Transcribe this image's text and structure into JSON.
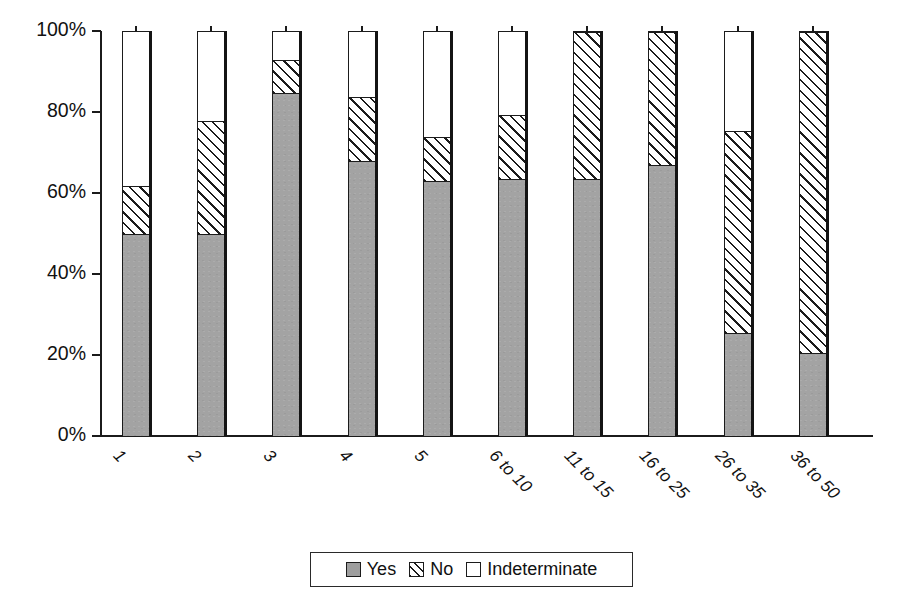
{
  "chart_data": {
    "type": "bar",
    "subtype": "stacked-100-percent",
    "title": "",
    "xlabel": "",
    "ylabel": "",
    "ylim": [
      0,
      100
    ],
    "ytick_labels": [
      "100%",
      "80%",
      "60%",
      "40%",
      "20%",
      "0%"
    ],
    "ytick_values": [
      100,
      80,
      60,
      40,
      20,
      0
    ],
    "grid": false,
    "legend_position": "bottom-center",
    "categories": [
      "1",
      "2",
      "3",
      "4",
      "5",
      "6 to 10",
      "11 to 15",
      "16 to 25",
      "26 to 35",
      "36 to 50"
    ],
    "series": [
      {
        "name": "Yes",
        "color": "#a3a3a3",
        "fill": "solid-gray",
        "values": [
          50,
          50,
          85,
          68,
          63,
          63.5,
          63.5,
          67,
          25.5,
          20.5
        ]
      },
      {
        "name": "No",
        "color": "#ffffff",
        "fill": "diagonal-hatch",
        "values": [
          12,
          28,
          8,
          16,
          11,
          16,
          36.5,
          33,
          50,
          79.5
        ]
      },
      {
        "name": "Indeterminate",
        "color": "#ffffff",
        "fill": "empty",
        "values": [
          38,
          22,
          7,
          16,
          26,
          20.5,
          0,
          0,
          24.5,
          0
        ]
      }
    ]
  },
  "legend": {
    "entries": [
      {
        "label": "Yes",
        "swatch": "solid-gray-swatch"
      },
      {
        "label": "No",
        "swatch": "hatched-swatch"
      },
      {
        "label": "Indeterminate",
        "swatch": "empty-swatch"
      }
    ]
  },
  "axis": {
    "y_ticks": [
      {
        "label": "100%",
        "value": 100
      },
      {
        "label": "80%",
        "value": 80
      },
      {
        "label": "60%",
        "value": 60
      },
      {
        "label": "40%",
        "value": 40
      },
      {
        "label": "20%",
        "value": 20
      },
      {
        "label": "0%",
        "value": 0
      }
    ]
  }
}
